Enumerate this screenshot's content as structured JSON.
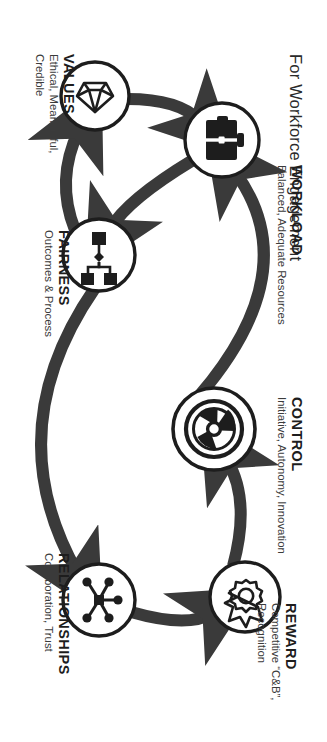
{
  "title": "For Workforce Engagement",
  "diagram": {
    "type": "infinity-cycle",
    "node_count": 6,
    "accent_color": "#3a3a3a",
    "circle_fill": "#ffffff",
    "text_color": "#1d1d1d"
  },
  "nodes": [
    {
      "key": "reward",
      "heading": "REWARD",
      "detail_line1": "Competitive “C&B”,",
      "detail_line2": "Recognition",
      "icon": "gear-medal-icon"
    },
    {
      "key": "control",
      "heading": "CONTROL",
      "detail_line1": "Initiative, Autonomy, Innovation",
      "detail_line2": "",
      "icon": "steering-wheel-icon"
    },
    {
      "key": "relationships",
      "heading": "RELATIONSHIPS",
      "detail_line1": "Collaboration, Trust",
      "detail_line2": "",
      "icon": "network-hub-icon"
    },
    {
      "key": "workload",
      "heading": "WORKLOAD",
      "detail_line1": "Balanced, Adequate Resources",
      "detail_line2": "",
      "icon": "briefcase-icon"
    },
    {
      "key": "fairness",
      "heading": "FAIRNESS",
      "detail_line1": "Outcomes & Process",
      "detail_line2": "",
      "icon": "flowchart-icon"
    },
    {
      "key": "values",
      "heading": "VALUES",
      "detail_line1": "Ethical, Meaningful,",
      "detail_line2": "Credible",
      "icon": "gem-diamond-icon"
    }
  ]
}
